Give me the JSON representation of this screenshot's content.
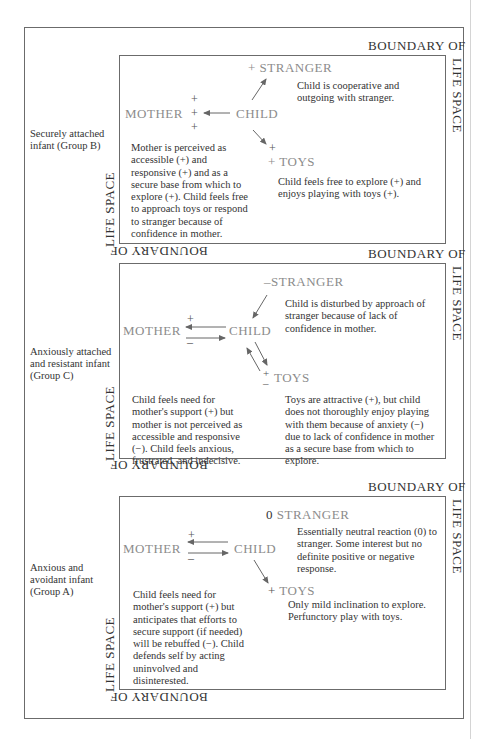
{
  "boundary": {
    "top": "BOUNDARY OF",
    "right": "LIFE SPACE",
    "bottom_flipped": "BOUNDARY OF",
    "left": "LIFE SPACE"
  },
  "nodes": {
    "mother": "MOTHER",
    "child": "CHILD",
    "stranger": "STRANGER",
    "toys": "TOYS"
  },
  "groups": [
    {
      "label": "Securely attached infant (Group B)",
      "stranger_sign": "+",
      "toys_sign_upper": "+",
      "toys_sign_lower": "+",
      "mother_signs": [
        "+",
        "+",
        "+"
      ],
      "stranger_desc": "Child is cooperative and outgoing with stranger.",
      "mother_desc": "Mother is perceived as accessible (+) and responsive (+) and as a secure base from which to explore (+). Child feels free to approach toys or respond to stranger because of confidence in mother.",
      "toys_desc": "Child feels free to explore (+) and enjoys playing with toys (+)."
    },
    {
      "label": "Anxiously attached and resistant infant (Group C)",
      "stranger_sign": "–",
      "toys_sign_upper": "+",
      "toys_sign_lower": "–",
      "mother_sign_upper": "+",
      "mother_sign_lower": "–",
      "stranger_desc": "Child is disturbed by approach of stranger because of lack of confidence in mother.",
      "mother_desc": "Child feels need for mother's support (+) but mother is not perceived as accessible and responsive (−). Child feels anxious, frustrated, and indecisive.",
      "toys_desc": "Toys are attractive (+), but child does not thoroughly enjoy playing with them because of anxiety (−) due to lack of confidence in mother as a secure base from which to explore."
    },
    {
      "label": "Anxious and avoidant infant (Group A)",
      "stranger_sign": "0",
      "toys_sign": "+",
      "mother_sign_upper": "+",
      "mother_sign_lower": "–",
      "stranger_desc": "Essentially neutral reaction (0) to stranger. Some interest but no definite positive or negative response.",
      "mother_desc": "Child feels need for mother's support (+) but anticipates that efforts to secure support (if needed) will be rebuffed (−). Child defends self by acting uninvolved and disinterested.",
      "toys_desc": "Only mild inclination to explore. Perfunctory play with toys."
    }
  ]
}
